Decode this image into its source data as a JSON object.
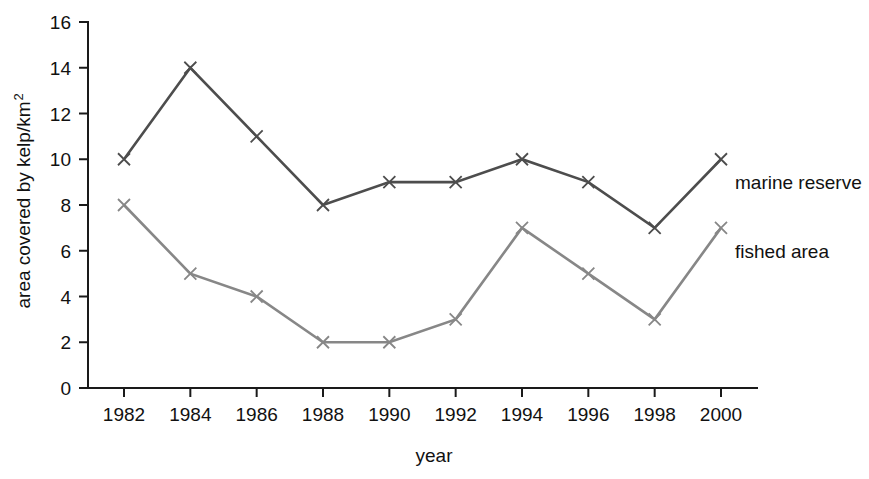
{
  "chart_data": {
    "type": "line",
    "title": "",
    "xlabel": "year",
    "ylabel": "area covered by kelp/km",
    "ylabel_superscript": "2",
    "categories": [
      1982,
      1984,
      1986,
      1988,
      1990,
      1992,
      1994,
      1996,
      1998,
      2000
    ],
    "x": [
      1982,
      1984,
      1986,
      1988,
      1990,
      1992,
      1994,
      1996,
      1998,
      2000
    ],
    "xtick_labels": [
      "1982",
      "1984",
      "1986",
      "1988",
      "1990",
      "1992",
      "1994",
      "1996",
      "1998",
      "2000"
    ],
    "ytick_labels": [
      "0",
      "2",
      "4",
      "6",
      "8",
      "10",
      "12",
      "14",
      "16"
    ],
    "yticks": [
      0,
      2,
      4,
      6,
      8,
      10,
      12,
      14,
      16
    ],
    "ylim": [
      0,
      16
    ],
    "xlim": [
      1982,
      2000
    ],
    "grid": false,
    "legend_position": "inline-right-of-series-end",
    "marker": "x",
    "series": [
      {
        "name": "marine reserve",
        "color": "#4d4d4d",
        "values": [
          10,
          14,
          11,
          8,
          9,
          9,
          10,
          9,
          7,
          10
        ]
      },
      {
        "name": "fished area",
        "color": "#878787",
        "values": [
          8,
          5,
          4,
          2,
          2,
          3,
          7,
          5,
          3,
          7
        ]
      }
    ],
    "annotations": [
      {
        "text": "marine reserve",
        "anchor_year": 2000,
        "anchor_value": 10
      },
      {
        "text": "fished area",
        "anchor_year": 2000,
        "anchor_value": 7
      }
    ]
  }
}
